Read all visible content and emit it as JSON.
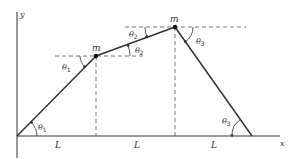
{
  "diagram": {
    "colors": {
      "line": "#333333",
      "dashed": "#555555",
      "background": "#ffffff"
    },
    "axes": {
      "x_label": "x",
      "y_label": "y"
    },
    "masses": [
      {
        "label": "m"
      },
      {
        "label": "m"
      }
    ],
    "spacings": [
      "L",
      "L",
      "L"
    ],
    "angles": [
      {
        "symbol": "θ",
        "sub": "1",
        "location": "at origin, between string and x-axis"
      },
      {
        "symbol": "θ",
        "sub": "1",
        "location": "at first mass, below horizontal dashed line"
      },
      {
        "symbol": "θ",
        "sub": "2",
        "location": "at first mass, above horizontal dashed line"
      },
      {
        "symbol": "θ",
        "sub": "2",
        "location": "at second mass, below horizontal dashed line (left)"
      },
      {
        "symbol": "θ",
        "sub": "3",
        "location": "at second mass, below horizontal dashed line (right)"
      },
      {
        "symbol": "θ",
        "sub": "3",
        "location": "at right support, between string and x-axis"
      }
    ]
  }
}
